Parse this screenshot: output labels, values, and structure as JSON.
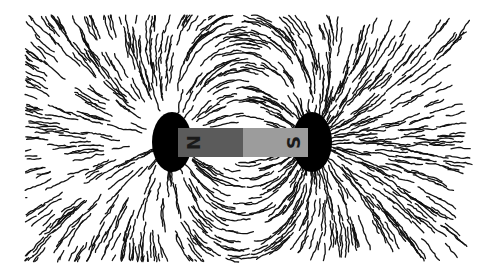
{
  "figure": {
    "magnet": {
      "north_label": "N",
      "south_label": "S",
      "north_color": "#5b5b5b",
      "south_color": "#9c9c9c"
    },
    "filing_color": "#111111",
    "background": "#ffffff"
  }
}
